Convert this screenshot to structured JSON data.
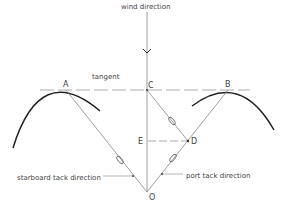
{
  "diagram": {
    "labels": {
      "wind_direction": "wind direction",
      "tangent": "tangent",
      "starboard_tack": "starboard tack direction",
      "port_tack": "port tack direction"
    },
    "points": {
      "A": "A",
      "B": "B",
      "C": "C",
      "D": "D",
      "E": "E",
      "O": "O"
    },
    "colors": {
      "line": "#888888",
      "arc": "#222222",
      "text": "#444444"
    }
  }
}
